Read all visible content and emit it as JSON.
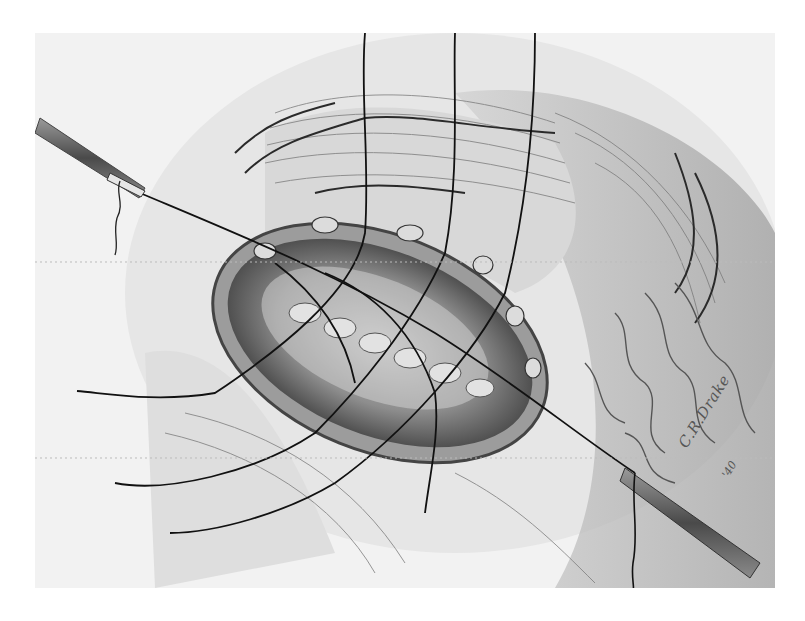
{
  "illustration": {
    "subject": "surgical suture illustration",
    "style": "grayscale pencil drawing",
    "signature": {
      "name": "C.R.Drake",
      "year": "'40"
    },
    "colors": {
      "background": "#ffffff",
      "paper": "#f2f2f2",
      "tissue_mid": "#b8b8b8",
      "tissue_dark": "#5a5a5a",
      "suture": "#1a1a1a",
      "instrument": "#6a6a6a"
    },
    "elements": {
      "needle_holder_left": "needle holder upper left",
      "needle_holder_right": "needle holder lower right",
      "wound": "oval surgical opening with interrupted sutures",
      "suture_count_vertical": 5
    }
  }
}
